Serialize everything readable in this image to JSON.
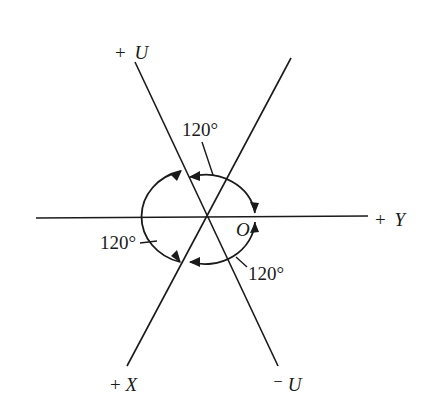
{
  "diagram": {
    "title": "",
    "origin_label": "O",
    "axes": [
      {
        "id": "plus-u",
        "sign": "+",
        "letter": "U",
        "label": "+ U"
      },
      {
        "id": "plus-y",
        "sign": "+",
        "letter": "Y",
        "label": "+ Y"
      },
      {
        "id": "plus-x",
        "sign": "+",
        "letter": "X",
        "label": "+X"
      },
      {
        "id": "minus-u",
        "sign": "⁻",
        "letter": "U",
        "label": "⁻U"
      }
    ],
    "angles": [
      {
        "id": "angle-u-y",
        "between": [
          "+U",
          "+Y"
        ],
        "label": "120°"
      },
      {
        "id": "angle-y-x",
        "between": [
          "+Y",
          "+X"
        ],
        "label": "120°"
      },
      {
        "id": "angle-x-u",
        "between": [
          "+X",
          "+U"
        ],
        "label": "120°"
      }
    ],
    "colors": {
      "ink": "#1a1a1a",
      "background": "#ffffff"
    }
  }
}
